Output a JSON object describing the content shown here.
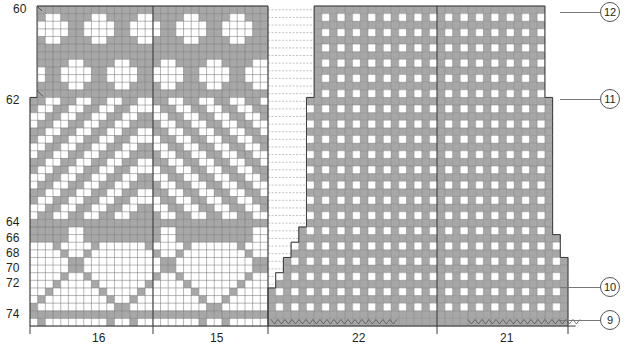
{
  "colors": {
    "grey": "#a7a7a7",
    "white": "#ffffff",
    "gridline": "#6f6f6f",
    "outline": "#3a3a3a",
    "dash": "#9a9a9a"
  },
  "grid": {
    "cell": 7.62,
    "top": 6,
    "rows": 42
  },
  "left_row_labels": [
    {
      "text": "60",
      "row": 0
    },
    {
      "text": "62",
      "row": 12
    },
    {
      "text": "64",
      "row": 28
    },
    {
      "text": "66",
      "row": 30
    },
    {
      "text": "68",
      "row": 32
    },
    {
      "text": "70",
      "row": 34
    },
    {
      "text": "72",
      "row": 36
    },
    {
      "text": "74",
      "row": 40
    }
  ],
  "bottom_labels": [
    {
      "text": "16",
      "x": 92
    },
    {
      "text": "15",
      "x": 210
    },
    {
      "text": "22",
      "x": 352
    },
    {
      "text": "21",
      "x": 500
    }
  ],
  "right_markers": [
    {
      "text": "12",
      "y": 12
    },
    {
      "text": "11",
      "y": 99
    },
    {
      "text": "10",
      "y": 287
    },
    {
      "text": "9",
      "y": 320
    }
  ],
  "left_panel": {
    "x": 30,
    "x_top": 37,
    "width_cols": 31,
    "divider_x": 153,
    "end_x": 268
  },
  "right_panel": {
    "x": 268,
    "end_x": 568,
    "divider_x": 437,
    "cols": 39
  }
}
